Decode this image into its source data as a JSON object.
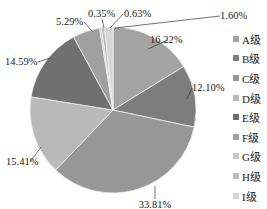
{
  "chart_data": {
    "type": "pie",
    "title": "",
    "categories": [
      "A级",
      "B级",
      "C级",
      "D级",
      "E级",
      "F级",
      "G级",
      "H级",
      "I级"
    ],
    "values": [
      16.22,
      12.1,
      33.81,
      15.41,
      14.59,
      5.29,
      0.35,
      0.63,
      1.6
    ],
    "labels": [
      "16.22%",
      "12.10%",
      "33.81%",
      "15.41%",
      "14.59%",
      "5.29%",
      "0.35%",
      "0.63%",
      "1.60%"
    ],
    "colors": [
      "#a3a3a3",
      "#7d7d7d",
      "#979797",
      "#b9b9b9",
      "#707070",
      "#a0a0a0",
      "#c8c8c8",
      "#bdbdbd",
      "#d6d6d6"
    ],
    "start_angle_deg": 0,
    "direction": "clockwise",
    "legend_position": "right"
  },
  "legend": {
    "items": [
      {
        "label": "A级",
        "color": "#a3a3a3"
      },
      {
        "label": "B级",
        "color": "#7d7d7d"
      },
      {
        "label": "C级",
        "color": "#979797"
      },
      {
        "label": "D级",
        "color": "#b9b9b9"
      },
      {
        "label": "E级",
        "color": "#707070"
      },
      {
        "label": "F级",
        "color": "#a0a0a0"
      },
      {
        "label": "G级",
        "color": "#c8c8c8"
      },
      {
        "label": "H级",
        "color": "#bdbdbd"
      },
      {
        "label": "I级",
        "color": "#d6d6d6"
      }
    ]
  }
}
